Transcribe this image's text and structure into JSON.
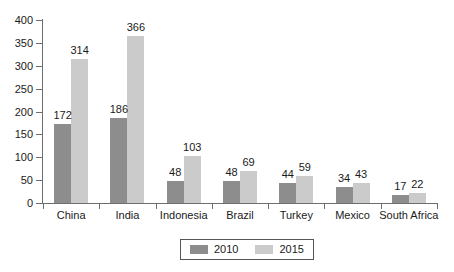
{
  "chart_data": {
    "type": "bar",
    "title": "",
    "subtitle": "",
    "xlabel": "",
    "ylabel": "",
    "ylim": [
      0,
      400
    ],
    "ytick_labels": [
      "0",
      "50",
      "100",
      "150",
      "200",
      "250",
      "300",
      "350",
      "400"
    ],
    "ytick_values": [
      0,
      50,
      100,
      150,
      200,
      250,
      300,
      350,
      400
    ],
    "grid": false,
    "legend_position": "bottom-center",
    "categories": [
      "China",
      "India",
      "Indonesia",
      "Brazil",
      "Turkey",
      "Mexico",
      "South Africa"
    ],
    "series": [
      {
        "name": "2010",
        "color": "#8d8d8d",
        "values": [
          172,
          186,
          48,
          48,
          44,
          34,
          17
        ]
      },
      {
        "name": "2015",
        "color": "#cbcbcb",
        "values": [
          314,
          366,
          103,
          69,
          59,
          43,
          22
        ]
      }
    ],
    "data_labels": [
      [
        "172",
        "314"
      ],
      [
        "186",
        "366"
      ],
      [
        "48",
        "103"
      ],
      [
        "48",
        "69"
      ],
      [
        "44",
        "59"
      ],
      [
        "34",
        "43"
      ],
      [
        "17",
        "22"
      ]
    ]
  },
  "legend": {
    "entries": [
      {
        "label": "2010",
        "color": "#8d8d8d"
      },
      {
        "label": "2015",
        "color": "#cbcbcb"
      }
    ]
  },
  "colors": {
    "background": "#ffffff",
    "axis": "#6e6e6e",
    "text": "#1a1a1a",
    "series_2010": "#8d8d8d",
    "series_2015": "#cbcbcb"
  }
}
